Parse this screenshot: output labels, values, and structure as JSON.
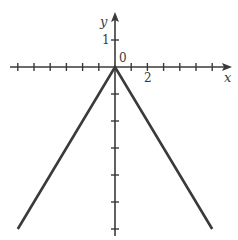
{
  "chart_data": {
    "type": "line",
    "title": "",
    "xlabel": "x",
    "ylabel": "y",
    "function": "y = -|x|",
    "series": [
      {
        "name": "y = -|x|",
        "x": [
          -6,
          0,
          6
        ],
        "y": [
          -6,
          0,
          -6
        ]
      }
    ],
    "xlim": [
      -6.5,
      7
    ],
    "ylim": [
      -6,
      2
    ],
    "x_ticks": [
      -6,
      -5,
      -4,
      -3,
      -2,
      -1,
      1,
      2,
      3,
      4,
      5,
      6
    ],
    "y_ticks": [
      1,
      -1,
      -2,
      -3,
      -4,
      -5,
      -6
    ],
    "tick_labels": {
      "origin": "0",
      "x": "2",
      "y": "1"
    },
    "grid": false,
    "legend": null
  },
  "colors": {
    "axis": "#3a3a3a",
    "line": "#3a3a3a",
    "background": "#ffffff"
  }
}
